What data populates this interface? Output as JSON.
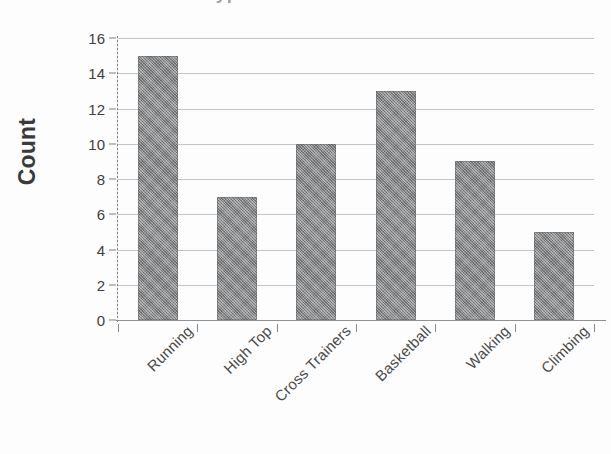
{
  "chart_data": {
    "type": "bar",
    "title": "Type of Athletic Shoe",
    "title_cropped": true,
    "xlabel": "",
    "ylabel": "Count",
    "categories": [
      "Running",
      "High Top",
      "Cross Trainers",
      "Basketball",
      "Walking",
      "Climbing"
    ],
    "values": [
      15,
      7,
      10,
      13,
      9,
      5
    ],
    "ylim": [
      0,
      16
    ],
    "ytick_step": 2,
    "yticks": [
      16,
      14,
      12,
      10,
      8,
      6,
      4,
      2,
      0
    ],
    "grid": true,
    "grid_axis": "y",
    "legend": false,
    "bar_color": "#7f8183",
    "gridline_color": "#b9bcbe",
    "axis_color": "#8a8d8f",
    "text_color": "#4a4a4a",
    "background": "#fdfdfd",
    "xtick_label_rotation": -45
  }
}
